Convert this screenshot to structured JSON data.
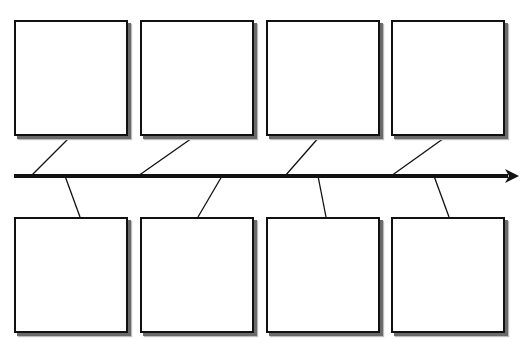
{
  "diagram": {
    "type": "timeline-fishbone",
    "colors": {
      "line": "#111111",
      "box_border": "#111111",
      "box_fill": "#ffffff",
      "shadow": "#6a6a6a",
      "background": "#ffffff"
    },
    "spine": {
      "x1": 14,
      "y": 176,
      "x2": 508,
      "tip_x": 519,
      "stroke_width": 4
    },
    "top_boxes": [
      {
        "id": "top-1",
        "x": 14,
        "y": 20,
        "w": 114,
        "h": 116,
        "text": ""
      },
      {
        "id": "top-2",
        "x": 140,
        "y": 20,
        "w": 114,
        "h": 116,
        "text": ""
      },
      {
        "id": "top-3",
        "x": 266,
        "y": 20,
        "w": 114,
        "h": 116,
        "text": ""
      },
      {
        "id": "top-4",
        "x": 391,
        "y": 20,
        "w": 114,
        "h": 116,
        "text": ""
      }
    ],
    "bottom_boxes": [
      {
        "id": "bottom-1",
        "x": 14,
        "y": 217,
        "w": 114,
        "h": 116,
        "text": ""
      },
      {
        "id": "bottom-2",
        "x": 140,
        "y": 217,
        "w": 114,
        "h": 116,
        "text": ""
      },
      {
        "id": "bottom-3",
        "x": 266,
        "y": 217,
        "w": 114,
        "h": 116,
        "text": ""
      },
      {
        "id": "bottom-4",
        "x": 391,
        "y": 217,
        "w": 114,
        "h": 116,
        "text": ""
      }
    ],
    "connectors": [
      {
        "from": "top-1",
        "x1": 71,
        "y1": 136,
        "x2": 31,
        "y2": 176
      },
      {
        "from": "top-2",
        "x1": 195,
        "y1": 136,
        "x2": 138,
        "y2": 176
      },
      {
        "from": "top-3",
        "x1": 320,
        "y1": 136,
        "x2": 285,
        "y2": 176
      },
      {
        "from": "top-4",
        "x1": 447,
        "y1": 136,
        "x2": 391,
        "y2": 176
      },
      {
        "from": "bottom-1",
        "x1": 65,
        "y1": 176,
        "x2": 80,
        "y2": 217
      },
      {
        "from": "bottom-2",
        "x1": 222,
        "y1": 176,
        "x2": 198,
        "y2": 217
      },
      {
        "from": "bottom-3",
        "x1": 318,
        "y1": 176,
        "x2": 326,
        "y2": 217
      },
      {
        "from": "bottom-4",
        "x1": 434,
        "y1": 176,
        "x2": 449,
        "y2": 217
      }
    ]
  }
}
